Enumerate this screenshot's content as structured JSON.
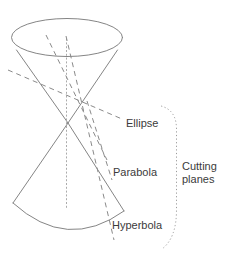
{
  "diagram": {
    "labels": {
      "ellipse": "Ellipse",
      "parabola": "Parabola",
      "hyperbola": "Hyperbola",
      "cutting_planes_line1": "Cutting",
      "cutting_planes_line2": "planes"
    },
    "colors": {
      "background": "#ffffff",
      "cone_stroke": "#858585",
      "plane_dash_stroke": "#8a8a8a",
      "axis_dot_stroke": "#ababab",
      "brace_dot_stroke": "#9b9b9b",
      "label_text": "#3b3b3b"
    }
  }
}
